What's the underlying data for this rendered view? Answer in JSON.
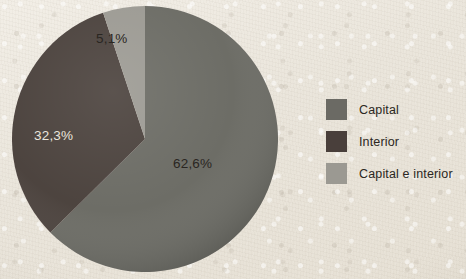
{
  "background": {
    "paper_color": "#ece7dd",
    "description": "scanned-book cream paper texture"
  },
  "chart_data": {
    "type": "pie",
    "title": "",
    "subtitle": "",
    "xlabel": "",
    "ylabel": "",
    "legend_position": "right",
    "grid": false,
    "start_angle_deg": 0,
    "direction": "clockwise",
    "categories": [
      "Capital",
      "Interior",
      "Capital e interior"
    ],
    "values": [
      62.6,
      32.3,
      5.1
    ],
    "value_labels": [
      "62,6%",
      "32,3%",
      "5,1%"
    ],
    "colors": [
      "#6b6a64",
      "#493f3b",
      "#9b9992"
    ],
    "slices": [
      {
        "name": "Capital",
        "value": 62.6,
        "label": "62,6%",
        "color": "#6b6a64",
        "label_color": "#2a2622",
        "start_deg": 0.0,
        "end_deg": 225.36
      },
      {
        "name": "Interior",
        "value": 32.3,
        "label": "32,3%",
        "color": "#493f3b",
        "label_color": "#e9e5dd",
        "start_deg": 225.36,
        "end_deg": 341.64
      },
      {
        "name": "Capital e interior",
        "value": 5.1,
        "label": "5,1%",
        "color": "#9b9992",
        "label_color": "#2a2622",
        "start_deg": 341.64,
        "end_deg": 360.0
      }
    ]
  },
  "legend": {
    "items": [
      {
        "label": "Capital",
        "color": "#6b6a64"
      },
      {
        "label": "Interior",
        "color": "#493f3b"
      },
      {
        "label": "Capital e interior",
        "color": "#9b9992"
      }
    ]
  }
}
